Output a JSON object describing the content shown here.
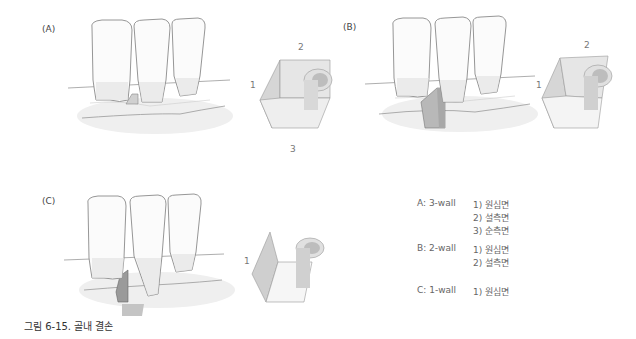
{
  "panels": {
    "a": {
      "label": "(A)",
      "walls": [
        "1",
        "2",
        "3"
      ]
    },
    "b": {
      "label": "(B)",
      "walls": [
        "1",
        "2"
      ]
    },
    "c": {
      "label": "(C)",
      "walls": [
        "1"
      ]
    }
  },
  "legend": [
    {
      "key": "A: 3-wall",
      "items": [
        "1) 원심면",
        "2) 설측면",
        "3) 순측면"
      ]
    },
    {
      "key": "B: 2-wall",
      "items": [
        "1) 원심면",
        "2) 설측면"
      ]
    },
    {
      "key": "C: 1-wall",
      "items": [
        "1) 원심면"
      ]
    }
  ],
  "caption": "그림 6-15. 골내 결손",
  "colors": {
    "tooth_outline": "#8a8a8a",
    "tooth_fill": "#fbfbfb",
    "bone_shade": "#ececec",
    "wall_fill": "#d9d9d9",
    "graft_fill": "#b8b8b8",
    "text": "#555555"
  }
}
